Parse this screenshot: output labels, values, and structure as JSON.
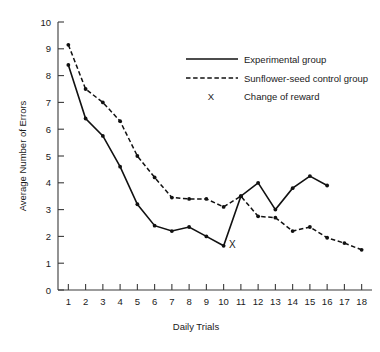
{
  "chart_data": {
    "type": "line",
    "title": "",
    "xlabel": "Daily Trials",
    "ylabel": "Average Number of Errors",
    "xlim": [
      0.4,
      18.6
    ],
    "ylim": [
      0,
      10
    ],
    "xticks": [
      1,
      2,
      3,
      4,
      5,
      6,
      7,
      8,
      9,
      10,
      11,
      12,
      13,
      14,
      15,
      16,
      17,
      18
    ],
    "yticks": [
      0,
      1,
      2,
      3,
      4,
      5,
      6,
      7,
      8,
      9,
      10
    ],
    "xticklabels": [
      "1",
      "2",
      "3",
      "4",
      "5",
      "6",
      "7",
      "8",
      "9",
      "10",
      "11",
      "12",
      "13",
      "14",
      "15",
      "16",
      "17",
      "18"
    ],
    "yticklabels": [
      "0",
      "1",
      "2",
      "3",
      "4",
      "5",
      "6",
      "7",
      "8",
      "9",
      "10"
    ],
    "grid": false,
    "legend_position": "top-right",
    "series": [
      {
        "name": "Experimental group",
        "style": "solid",
        "x": [
          1,
          2,
          3,
          4,
          5,
          6,
          7,
          8,
          9,
          10,
          11,
          12,
          13,
          14,
          15,
          16
        ],
        "values": [
          8.4,
          6.4,
          5.75,
          4.6,
          3.2,
          2.4,
          2.2,
          2.35,
          2.0,
          1.65,
          3.5,
          4.0,
          3.0,
          3.8,
          4.25,
          3.9
        ]
      },
      {
        "name": "Sunflower-seed control group",
        "style": "dashed",
        "x": [
          1,
          2,
          3,
          4,
          5,
          6,
          7,
          8,
          9,
          10,
          11,
          12,
          13,
          14,
          15,
          16,
          17,
          18
        ],
        "values": [
          9.15,
          7.5,
          7.0,
          6.3,
          5.0,
          4.2,
          3.45,
          3.4,
          3.4,
          3.1,
          3.5,
          2.75,
          2.7,
          2.2,
          2.35,
          1.95,
          1.75,
          1.5
        ]
      }
    ],
    "annotations": [
      {
        "label": "X",
        "x": 10.5,
        "y": 1.55,
        "meaning": "Change of reward"
      }
    ]
  },
  "legend": {
    "items": [
      {
        "label": "Experimental group",
        "marker": "solid-line"
      },
      {
        "label": "Sunflower-seed control group",
        "marker": "dashed-line"
      },
      {
        "label": "Change of reward",
        "marker": "X"
      }
    ],
    "x_symbol": "X"
  }
}
